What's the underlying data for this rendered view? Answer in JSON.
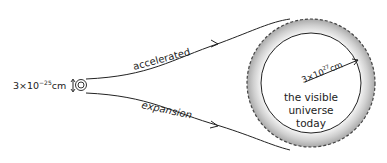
{
  "diagram": {
    "start_size_label": "3×10",
    "start_size_exp": "−25",
    "start_size_unit": "cm",
    "top_path_label": "accelerated",
    "bottom_path_label": "expansion",
    "radius_label": "3×10",
    "radius_exp": "27",
    "radius_unit": "cm",
    "universe_label_line1": "the visible",
    "universe_label_line2": "universe",
    "universe_label_line3": "today"
  }
}
